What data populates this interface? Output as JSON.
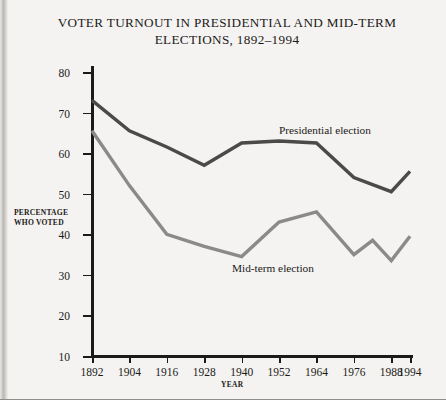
{
  "title": {
    "line1": "VOTER TURNOUT IN PRESIDENTIAL AND MID-TERM",
    "line2": "ELECTIONS, 1892–1994"
  },
  "axis": {
    "y_title_line1": "PERCENTAGE",
    "y_title_line2": "WHO VOTED",
    "x_title": "YEAR"
  },
  "labels": {
    "presidential": "Presidential election",
    "midterm": "Mid-term election"
  },
  "colors": {
    "presidential_line": "#4a4a4a",
    "midterm_line": "#8a8a8a",
    "axis": "#1c1a18",
    "paper": "#f4f3f1"
  },
  "chart_data": {
    "type": "line",
    "title": "VOTER TURNOUT IN PRESIDENTIAL AND MID-TERM ELECTIONS, 1892–1994",
    "xlabel": "YEAR",
    "ylabel": "PERCENTAGE WHO VOTED",
    "xlim": [
      1892,
      1994
    ],
    "ylim": [
      10,
      80
    ],
    "yticks": [
      10,
      20,
      30,
      40,
      50,
      60,
      70,
      80
    ],
    "xticks": [
      1892,
      1904,
      1916,
      1928,
      1940,
      1952,
      1964,
      1976,
      1988,
      1994
    ],
    "grid": false,
    "legend": "inline-annotations",
    "series": [
      {
        "name": "Presidential election",
        "color": "#4a4a4a",
        "x": [
          1892,
          1904,
          1916,
          1928,
          1940,
          1952,
          1964,
          1976,
          1988,
          1994
        ],
        "values": [
          73,
          65.5,
          61.5,
          57,
          62.5,
          63,
          62.5,
          54,
          50.5,
          55.5
        ]
      },
      {
        "name": "Mid-term election",
        "color": "#8a8a8a",
        "x": [
          1892,
          1904,
          1916,
          1928,
          1940,
          1952,
          1964,
          1976,
          1982,
          1988,
          1994
        ],
        "values": [
          65.5,
          52,
          40,
          37,
          34.5,
          43,
          45.5,
          35,
          38.5,
          33.5,
          39.5
        ]
      }
    ]
  }
}
